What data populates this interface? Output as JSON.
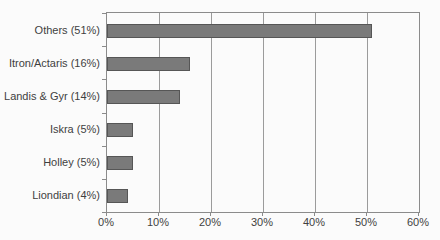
{
  "chart_data": {
    "type": "bar",
    "orientation": "horizontal",
    "categories": [
      "Others (51%)",
      "Itron/Actaris (16%)",
      "Landis & Gyr (14%)",
      "Iskra (5%)",
      "Holley (5%)",
      "Liondian (4%)"
    ],
    "values": [
      51,
      16,
      14,
      5,
      5,
      4
    ],
    "value_unit": "%",
    "xlim": [
      0,
      60
    ],
    "x_ticks": [
      0,
      10,
      20,
      30,
      40,
      50,
      60
    ],
    "x_tick_labels": [
      "0%",
      "10%",
      "20%",
      "30%",
      "40%",
      "50%",
      "60%"
    ],
    "grid": true,
    "legend": "none",
    "colors": {
      "bar_fill": "#7a7a7a",
      "bar_border": "#565656",
      "gridline": "#9b9b9b",
      "plot_border": "#8b8b8b",
      "text": "#3f3f3f",
      "background": "#fbfbfb"
    }
  }
}
